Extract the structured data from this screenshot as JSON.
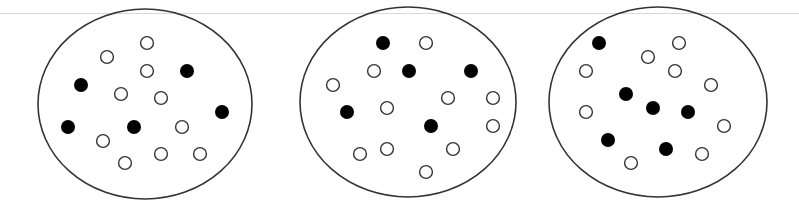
{
  "figure": {
    "stroke_color": "#333333",
    "filled_color": "#000000",
    "open_color": "#ffffff",
    "dot_radius": 7,
    "containers": [
      {
        "id": "container-1",
        "ellipse": {
          "cx": 145,
          "cy": 104,
          "rx": 107,
          "ry": 95
        },
        "filled_count": 5,
        "open_count": 10,
        "particles": [
          {
            "x": 147,
            "y": 43,
            "type": "open"
          },
          {
            "x": 107,
            "y": 57,
            "type": "open"
          },
          {
            "x": 147,
            "y": 71,
            "type": "open"
          },
          {
            "x": 187,
            "y": 71,
            "type": "filled"
          },
          {
            "x": 81,
            "y": 85,
            "type": "filled"
          },
          {
            "x": 121,
            "y": 94,
            "type": "open"
          },
          {
            "x": 161,
            "y": 98,
            "type": "open"
          },
          {
            "x": 222,
            "y": 112,
            "type": "filled"
          },
          {
            "x": 68,
            "y": 127,
            "type": "filled"
          },
          {
            "x": 134,
            "y": 127,
            "type": "filled"
          },
          {
            "x": 182,
            "y": 127,
            "type": "open"
          },
          {
            "x": 103,
            "y": 141,
            "type": "open"
          },
          {
            "x": 161,
            "y": 154,
            "type": "open"
          },
          {
            "x": 200,
            "y": 154,
            "type": "open"
          },
          {
            "x": 125,
            "y": 163,
            "type": "open"
          }
        ]
      },
      {
        "id": "container-2",
        "ellipse": {
          "cx": 408,
          "cy": 102,
          "rx": 108,
          "ry": 95
        },
        "filled_count": 5,
        "open_count": 11,
        "particles": [
          {
            "x": 383,
            "y": 43,
            "type": "filled"
          },
          {
            "x": 426,
            "y": 43,
            "type": "open"
          },
          {
            "x": 374,
            "y": 71,
            "type": "open"
          },
          {
            "x": 409,
            "y": 71,
            "type": "filled"
          },
          {
            "x": 471,
            "y": 71,
            "type": "filled"
          },
          {
            "x": 333,
            "y": 85,
            "type": "open"
          },
          {
            "x": 448,
            "y": 98,
            "type": "open"
          },
          {
            "x": 493,
            "y": 98,
            "type": "open"
          },
          {
            "x": 387,
            "y": 108,
            "type": "open"
          },
          {
            "x": 347,
            "y": 112,
            "type": "filled"
          },
          {
            "x": 431,
            "y": 126,
            "type": "filled"
          },
          {
            "x": 493,
            "y": 126,
            "type": "open"
          },
          {
            "x": 360,
            "y": 154,
            "type": "open"
          },
          {
            "x": 387,
            "y": 149,
            "type": "open"
          },
          {
            "x": 453,
            "y": 149,
            "type": "open"
          },
          {
            "x": 426,
            "y": 172,
            "type": "open"
          }
        ]
      },
      {
        "id": "container-3",
        "ellipse": {
          "cx": 658,
          "cy": 102,
          "rx": 109,
          "ry": 95
        },
        "filled_count": 6,
        "open_count": 9,
        "particles": [
          {
            "x": 599,
            "y": 43,
            "type": "filled"
          },
          {
            "x": 679,
            "y": 43,
            "type": "open"
          },
          {
            "x": 648,
            "y": 57,
            "type": "open"
          },
          {
            "x": 586,
            "y": 71,
            "type": "open"
          },
          {
            "x": 675,
            "y": 71,
            "type": "open"
          },
          {
            "x": 711,
            "y": 85,
            "type": "open"
          },
          {
            "x": 626,
            "y": 94,
            "type": "filled"
          },
          {
            "x": 653,
            "y": 108,
            "type": "filled"
          },
          {
            "x": 688,
            "y": 112,
            "type": "filled"
          },
          {
            "x": 586,
            "y": 112,
            "type": "open"
          },
          {
            "x": 724,
            "y": 126,
            "type": "open"
          },
          {
            "x": 608,
            "y": 140,
            "type": "filled"
          },
          {
            "x": 666,
            "y": 149,
            "type": "filled"
          },
          {
            "x": 702,
            "y": 154,
            "type": "open"
          },
          {
            "x": 631,
            "y": 163,
            "type": "open"
          }
        ]
      }
    ]
  }
}
